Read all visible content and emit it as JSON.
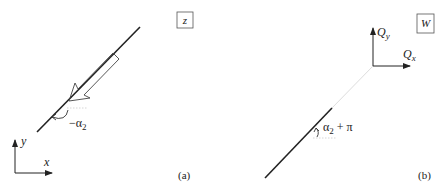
{
  "figure": {
    "panel_a": {
      "plane_label": "z",
      "caption": "(a)",
      "angle_label": "−α",
      "angle_subscript": "2",
      "axes": {
        "x_label": "x",
        "y_label": "y"
      }
    },
    "panel_b": {
      "plane_label": "W",
      "caption": "(b)",
      "angle_label": "α",
      "angle_subscript": "2",
      "angle_suffix": " + π",
      "axes": {
        "x_label": "Q",
        "x_sub": "x",
        "y_label": "Q",
        "y_sub": "y"
      }
    },
    "colors": {
      "line": "#222222",
      "faint": "#d8d8d8",
      "background": "#ffffff"
    }
  }
}
